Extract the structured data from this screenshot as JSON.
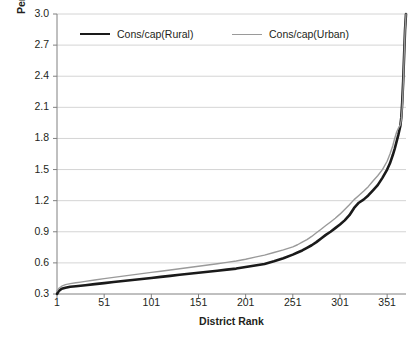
{
  "chart_data": {
    "type": "line",
    "title": "",
    "xlabel": "District Rank",
    "ylabel": "Per capita Monthly Consumption (000 Rs)",
    "xlim": [
      1,
      371
    ],
    "ylim": [
      0.3,
      3.0
    ],
    "xticks": [
      1,
      51,
      101,
      151,
      201,
      251,
      301,
      351
    ],
    "yticks": [
      "0.3",
      "0.6",
      "0.9",
      "1.2",
      "1.5",
      "1.8",
      "2.1",
      "2.4",
      "2.7",
      "3.0"
    ],
    "grid": "horizontal",
    "legend_position": "top-inside",
    "series": [
      {
        "name": "Cons/cap(Rural)",
        "color": "#1a1a1a",
        "width": 2.6,
        "x": [
          1,
          3,
          6,
          10,
          15,
          21,
          26,
          31,
          41,
          51,
          61,
          71,
          81,
          91,
          101,
          111,
          121,
          131,
          141,
          151,
          161,
          171,
          181,
          191,
          201,
          211,
          221,
          231,
          241,
          251,
          256,
          261,
          266,
          271,
          276,
          281,
          286,
          291,
          296,
          301,
          306,
          311,
          316,
          321,
          326,
          331,
          336,
          341,
          346,
          351,
          354,
          357,
          359,
          361,
          363,
          365,
          366,
          367,
          368,
          369,
          370,
          371
        ],
        "y": [
          0.3,
          0.33,
          0.35,
          0.36,
          0.37,
          0.375,
          0.38,
          0.385,
          0.395,
          0.405,
          0.415,
          0.425,
          0.435,
          0.445,
          0.455,
          0.465,
          0.475,
          0.485,
          0.495,
          0.505,
          0.515,
          0.525,
          0.535,
          0.545,
          0.56,
          0.575,
          0.59,
          0.615,
          0.645,
          0.68,
          0.7,
          0.72,
          0.745,
          0.77,
          0.8,
          0.835,
          0.87,
          0.9,
          0.935,
          0.97,
          1.01,
          1.06,
          1.13,
          1.18,
          1.21,
          1.25,
          1.3,
          1.35,
          1.42,
          1.5,
          1.56,
          1.64,
          1.7,
          1.77,
          1.84,
          1.92,
          2.0,
          2.15,
          2.35,
          2.6,
          2.85,
          3.0
        ]
      },
      {
        "name": "Cons/cap(Urban)",
        "color": "#9a9a9a",
        "width": 1.4,
        "x": [
          1,
          3,
          6,
          10,
          15,
          21,
          26,
          31,
          41,
          51,
          61,
          71,
          81,
          91,
          101,
          111,
          121,
          131,
          141,
          151,
          161,
          171,
          181,
          191,
          201,
          211,
          221,
          231,
          241,
          251,
          256,
          261,
          266,
          271,
          276,
          281,
          286,
          291,
          296,
          301,
          306,
          311,
          316,
          321,
          326,
          331,
          336,
          341,
          346,
          351,
          354,
          357,
          359,
          361,
          363,
          365,
          366,
          367,
          368,
          369,
          370,
          371
        ],
        "y": [
          0.33,
          0.355,
          0.375,
          0.39,
          0.4,
          0.408,
          0.415,
          0.422,
          0.435,
          0.448,
          0.46,
          0.472,
          0.484,
          0.496,
          0.508,
          0.52,
          0.532,
          0.544,
          0.556,
          0.568,
          0.58,
          0.592,
          0.605,
          0.618,
          0.635,
          0.655,
          0.675,
          0.7,
          0.725,
          0.755,
          0.775,
          0.8,
          0.825,
          0.855,
          0.89,
          0.925,
          0.96,
          0.995,
          1.03,
          1.07,
          1.115,
          1.16,
          1.21,
          1.25,
          1.29,
          1.335,
          1.39,
          1.44,
          1.5,
          1.58,
          1.65,
          1.73,
          1.8,
          1.86,
          1.9,
          1.93,
          1.98,
          2.1,
          2.3,
          2.58,
          2.84,
          3.0
        ]
      }
    ]
  },
  "axes": {
    "y_title": "Per capita Monthly Consumption (000 Rs)",
    "x_title": "District Rank"
  },
  "legend": {
    "items": [
      {
        "label": "Cons/cap(Rural)"
      },
      {
        "label": "Cons/cap(Urban)"
      }
    ]
  }
}
